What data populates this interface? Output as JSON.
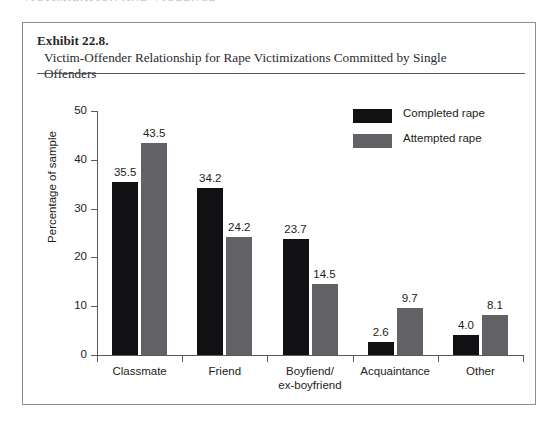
{
  "page": {
    "running_head": "VICTIMIZATION AND VIOLENCE"
  },
  "exhibit": {
    "label": "Exhibit 22.8.",
    "title": "Victim-Offender Relationship for Rape Victimizations Committed by Single Offenders"
  },
  "colors": {
    "completed": "#111113",
    "attempted": "#626266",
    "axis": "#58585e",
    "box_border": "#8d8d93",
    "text": "#1d1d20"
  },
  "chart_data": {
    "type": "bar",
    "title": "Victim-Offender Relationship for Rape Victimizations Committed by Single Offenders",
    "xlabel": "",
    "ylabel": "Percentage of sample",
    "ylim": [
      0,
      50
    ],
    "yticks": [
      0,
      10,
      20,
      30,
      40,
      50
    ],
    "ytick_labels": [
      "0",
      "10",
      "20",
      "30",
      "40",
      "50"
    ],
    "grid": false,
    "legend_position": "upper right",
    "categories": [
      "Classmate",
      "Boyfiend/\nex-boyfriend",
      "Friend",
      "Acquaintance",
      "Other"
    ],
    "category_labels": [
      {
        "line1": "Classmate",
        "line2": ""
      },
      {
        "line1": "Friend",
        "line2": ""
      },
      {
        "line1": "Boyfiend/",
        "line2": "ex-boyfriend"
      },
      {
        "line1": "Acquaintance",
        "line2": ""
      },
      {
        "line1": "Other",
        "line2": ""
      }
    ],
    "series": [
      {
        "name": "Completed rape",
        "color": "#111113",
        "values": [
          35.5,
          34.2,
          23.7,
          2.6,
          4.0
        ],
        "value_labels": [
          "35.5",
          "34.2",
          "23.7",
          "2.6",
          "4.0"
        ]
      },
      {
        "name": "Attempted rape",
        "color": "#626266",
        "values": [
          43.5,
          24.2,
          14.5,
          9.7,
          8.1
        ],
        "value_labels": [
          "43.5",
          "24.2",
          "14.5",
          "9.7",
          "8.1"
        ]
      }
    ]
  }
}
